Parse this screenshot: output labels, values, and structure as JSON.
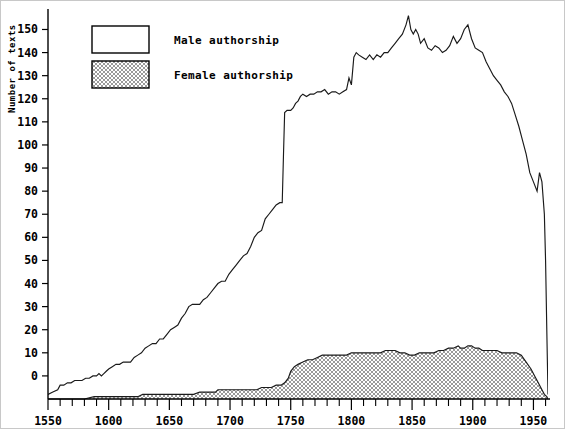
{
  "chart_data": {
    "type": "area",
    "title": "",
    "subtitle": "",
    "xlabel": "",
    "ylabel": "Number of texts",
    "xlim": [
      1550,
      1962
    ],
    "ylim": [
      -10,
      158
    ],
    "grid": false,
    "legend_position": "top-left",
    "y_ticks": [
      0,
      10,
      20,
      30,
      40,
      50,
      60,
      70,
      80,
      90,
      100,
      110,
      120,
      130,
      140,
      150
    ],
    "y_tick_labels": [
      "0",
      "10",
      "20",
      "30",
      "40",
      "50",
      "60",
      "70",
      "80",
      "90",
      "100",
      "110",
      "120",
      "130",
      "140",
      "150"
    ],
    "x_ticks_major": [
      1550,
      1600,
      1650,
      1700,
      1750,
      1800,
      1850,
      1900,
      1950
    ],
    "x_tick_labels": [
      "1550",
      "1600",
      "1650",
      "1700",
      "1750",
      "1800",
      "1850",
      "1900",
      "1950"
    ],
    "x_ticks_minor_step": 10,
    "colors": {
      "line": "#1a1a1a",
      "male_fill": "#ffffff",
      "female_fill": "#e2e2e2",
      "axis": "#000000",
      "frame": "#c8c8c8"
    },
    "legend": [
      {
        "label": "Male authorship",
        "pattern": "solid-white",
        "fill": "#ffffff"
      },
      {
        "label": "Female authorship",
        "pattern": "stipple",
        "fill": "#e2e2e2"
      }
    ],
    "series": [
      {
        "name": "Male authorship",
        "pattern": "solid-white",
        "x": [
          1550,
          1554,
          1558,
          1560,
          1563,
          1566,
          1569,
          1572,
          1575,
          1578,
          1581,
          1584,
          1587,
          1590,
          1592,
          1594,
          1596,
          1598,
          1600,
          1603,
          1606,
          1609,
          1612,
          1615,
          1618,
          1621,
          1624,
          1627,
          1630,
          1633,
          1636,
          1639,
          1642,
          1645,
          1648,
          1651,
          1654,
          1657,
          1660,
          1663,
          1666,
          1669,
          1672,
          1675,
          1678,
          1681,
          1684,
          1687,
          1690,
          1693,
          1696,
          1699,
          1702,
          1705,
          1708,
          1711,
          1714,
          1717,
          1720,
          1723,
          1726,
          1729,
          1732,
          1735,
          1738,
          1741,
          1743,
          1744,
          1745,
          1747,
          1750,
          1752,
          1754,
          1756,
          1758,
          1760,
          1763,
          1766,
          1769,
          1772,
          1775,
          1778,
          1781,
          1784,
          1787,
          1790,
          1793,
          1796,
          1798,
          1800,
          1802,
          1804,
          1806,
          1809,
          1812,
          1815,
          1818,
          1821,
          1824,
          1827,
          1830,
          1833,
          1836,
          1839,
          1842,
          1845,
          1847,
          1849,
          1851,
          1853,
          1855,
          1857,
          1860,
          1863,
          1866,
          1869,
          1872,
          1875,
          1878,
          1881,
          1884,
          1887,
          1890,
          1893,
          1896,
          1899,
          1902,
          1905,
          1908,
          1911,
          1914,
          1917,
          1920,
          1923,
          1926,
          1929,
          1932,
          1935,
          1938,
          1941,
          1944,
          1947,
          1950,
          1953,
          1955,
          1957,
          1959,
          1960,
          1961,
          1962
        ],
        "y": [
          -8,
          -7,
          -6,
          -4,
          -4,
          -3,
          -3,
          -2,
          -2,
          -2,
          -1,
          -1,
          0,
          0,
          1,
          0,
          1,
          2,
          3,
          4,
          5,
          5,
          6,
          6,
          6,
          8,
          9,
          10,
          12,
          13,
          14,
          14,
          16,
          16,
          18,
          20,
          21,
          22,
          25,
          27,
          30,
          31,
          31,
          31,
          33,
          34,
          36,
          38,
          40,
          41,
          41,
          44,
          46,
          48,
          50,
          52,
          53,
          56,
          60,
          62,
          63,
          68,
          70,
          72,
          74,
          75,
          75,
          95,
          114,
          115,
          115,
          116,
          118,
          119,
          121,
          122,
          121,
          122,
          122,
          123,
          123,
          124,
          122,
          123,
          123,
          122,
          123,
          124,
          129,
          126,
          138,
          140,
          139,
          138,
          137,
          139,
          137,
          139,
          138,
          140,
          140,
          142,
          144,
          146,
          148,
          152,
          156,
          150,
          148,
          150,
          148,
          144,
          146,
          142,
          141,
          143,
          142,
          140,
          141,
          143,
          147,
          144,
          146,
          150,
          152,
          146,
          142,
          141,
          140,
          136,
          133,
          130,
          128,
          126,
          123,
          121,
          118,
          113,
          108,
          102,
          96,
          88,
          84,
          80,
          88,
          84,
          70,
          50,
          20,
          -8
        ]
      },
      {
        "name": "Female authorship",
        "pattern": "stipple",
        "x": [
          1550,
          1560,
          1570,
          1580,
          1588,
          1592,
          1596,
          1600,
          1605,
          1610,
          1615,
          1620,
          1624,
          1628,
          1632,
          1636,
          1640,
          1645,
          1650,
          1655,
          1660,
          1665,
          1670,
          1675,
          1680,
          1685,
          1688,
          1690,
          1694,
          1698,
          1702,
          1706,
          1710,
          1714,
          1718,
          1722,
          1726,
          1730,
          1734,
          1738,
          1742,
          1745,
          1748,
          1750,
          1753,
          1756,
          1760,
          1764,
          1768,
          1772,
          1776,
          1780,
          1784,
          1788,
          1792,
          1796,
          1800,
          1804,
          1808,
          1812,
          1816,
          1820,
          1824,
          1828,
          1832,
          1836,
          1840,
          1844,
          1848,
          1852,
          1856,
          1860,
          1864,
          1868,
          1872,
          1876,
          1880,
          1884,
          1888,
          1890,
          1893,
          1896,
          1899,
          1902,
          1905,
          1908,
          1912,
          1916,
          1920,
          1924,
          1928,
          1932,
          1936,
          1940,
          1944,
          1948,
          1951,
          1954,
          1957,
          1959,
          1961,
          1962
        ],
        "y": [
          -10,
          -10,
          -10,
          -10,
          -9,
          -9,
          -9,
          -9,
          -9,
          -9,
          -9,
          -9,
          -9,
          -8,
          -8,
          -8,
          -8,
          -8,
          -8,
          -8,
          -8,
          -8,
          -8,
          -7,
          -7,
          -7,
          -7,
          -6,
          -6,
          -6,
          -6,
          -6,
          -6,
          -6,
          -6,
          -6,
          -5,
          -5,
          -5,
          -4,
          -4,
          -3,
          -1,
          2,
          4,
          5,
          6,
          7,
          7,
          8,
          9,
          9,
          9,
          9,
          9,
          9,
          10,
          10,
          10,
          10,
          10,
          10,
          10,
          11,
          11,
          11,
          10,
          10,
          9,
          9,
          10,
          10,
          10,
          10,
          11,
          11,
          12,
          12,
          13,
          12,
          12,
          13,
          13,
          12,
          12,
          11,
          11,
          11,
          11,
          10,
          10,
          10,
          10,
          9,
          6,
          3,
          0,
          -3,
          -6,
          -8,
          -9,
          -10
        ]
      }
    ]
  },
  "axis_title_text": "Number of texts"
}
